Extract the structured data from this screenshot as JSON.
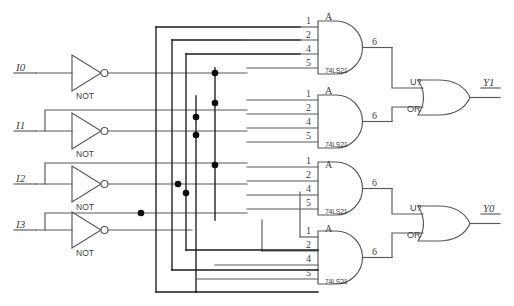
{
  "diagram": {
    "inputs": [
      {
        "name": "input-i0",
        "label": "I0"
      },
      {
        "name": "input-i1",
        "label": "I1"
      },
      {
        "name": "input-i2",
        "label": "I2"
      },
      {
        "name": "input-i3",
        "label": "I3"
      }
    ],
    "inverters": [
      {
        "name": "not-gate-0",
        "label": "NOT"
      },
      {
        "name": "not-gate-1",
        "label": "NOT"
      },
      {
        "name": "not-gate-2",
        "label": "NOT"
      },
      {
        "name": "not-gate-3",
        "label": "NOT"
      }
    ],
    "and_gates": [
      {
        "name": "and-gate-1",
        "ic": "74LS21",
        "section": "A",
        "pins": [
          "1",
          "2",
          "4",
          "5"
        ],
        "output_pin": "6"
      },
      {
        "name": "and-gate-2",
        "ic": "74LS21",
        "section": "A",
        "pins": [
          "1",
          "2",
          "4",
          "5"
        ],
        "output_pin": "6"
      },
      {
        "name": "and-gate-3",
        "ic": "74LS21",
        "section": "A",
        "pins": [
          "1",
          "2",
          "4",
          "5"
        ],
        "output_pin": "6"
      },
      {
        "name": "and-gate-4",
        "ic": "74LS21",
        "section": "A",
        "pins": [
          "1",
          "2",
          "4",
          "5"
        ],
        "output_pin": "6"
      }
    ],
    "or_gates": [
      {
        "name": "or-gate-y1",
        "ref": "U?",
        "type": "OR",
        "output": "Y1"
      },
      {
        "name": "or-gate-y0",
        "ref": "U?",
        "type": "OR",
        "output": "Y0"
      }
    ],
    "outputs": [
      {
        "name": "output-y1",
        "label": "Y1"
      },
      {
        "name": "output-y0",
        "label": "Y0"
      }
    ],
    "colors": {
      "wire": "#58595b",
      "wire_dark": "#1a1a1a",
      "junction": "#0d0d0d",
      "text": "#3f3f41",
      "background": "#ffffff"
    }
  }
}
